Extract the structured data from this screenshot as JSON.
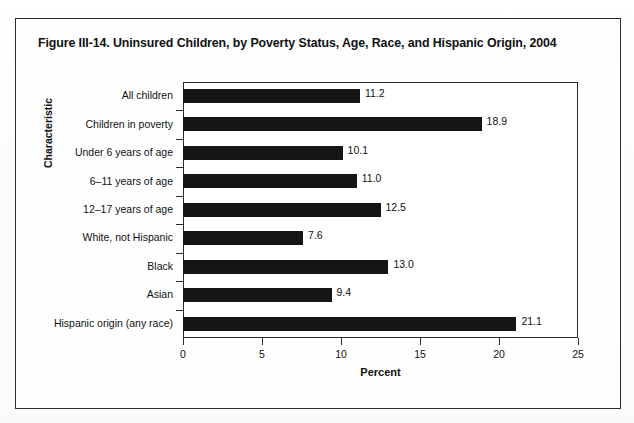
{
  "figure": {
    "title": "Figure III-14. Uninsured Children, by Poverty Status, Age, Race, and Hispanic Origin, 2004"
  },
  "chart_data": {
    "type": "bar",
    "orientation": "horizontal",
    "title": "Figure III-14. Uninsured Children, by Poverty Status, Age, Race, and Hispanic Origin, 2004",
    "xlabel": "Percent",
    "ylabel": "Characteristic",
    "categories": [
      "All children",
      "Children in poverty",
      "Under 6 years of age",
      "6–11 years of age",
      "12–17 years of age",
      "White, not Hispanic",
      "Black",
      "Asian",
      "Hispanic origin (any race)"
    ],
    "values": [
      11.2,
      18.9,
      10.1,
      11.0,
      12.5,
      7.6,
      13.0,
      9.4,
      21.1
    ],
    "value_labels": [
      "11.2",
      "18.9",
      "10.1",
      "11.0",
      "12.5",
      "7.6",
      "13.0",
      "9.4",
      "21.1"
    ],
    "xlim": [
      0,
      25
    ],
    "xticks": [
      0,
      5,
      10,
      15,
      20,
      25
    ],
    "xtick_labels": [
      "0",
      "5",
      "10",
      "15",
      "20",
      "25"
    ],
    "grid": false,
    "legend": false,
    "bar_color": "#151515",
    "frame_color": "#2b2b2b",
    "background_color": "#ffffff"
  }
}
